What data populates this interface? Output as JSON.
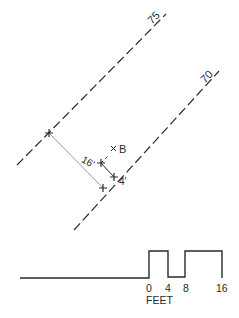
{
  "diagram": {
    "contours": [
      {
        "label": "75"
      },
      {
        "label": "70"
      }
    ],
    "point_label": "B",
    "dimensions": {
      "long": "16'",
      "short": "4'"
    },
    "scale": {
      "ticks": [
        "0",
        "4",
        "8",
        "16"
      ],
      "unit": "FEET"
    },
    "colors": {
      "line": "#2a2a2a",
      "dimension_line": "#9a9a9a",
      "background": "#ffffff"
    }
  }
}
